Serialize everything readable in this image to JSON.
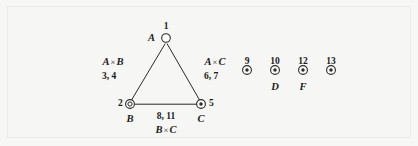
{
  "figure": {
    "kind": "graph-diagram",
    "background_color": "#f6f6f5",
    "frame_color": "#ebebe9",
    "ink_color": "#1b1b1b",
    "triangle": {
      "vertices": [
        {
          "id": "A",
          "node_number": "1",
          "letter": "A",
          "marker": "open-circle",
          "x": 166,
          "y": 38
        },
        {
          "id": "B",
          "node_number": "2",
          "letter": "B",
          "marker": "double-circle",
          "x": 130,
          "y": 104
        },
        {
          "id": "C",
          "node_number": "5",
          "letter": "C",
          "marker": "dotted-circle",
          "x": 201,
          "y": 104
        }
      ],
      "edges": [
        {
          "id": "AB",
          "product": "A",
          "product_operand": "B",
          "operator": "×",
          "numbers": "3, 4"
        },
        {
          "id": "AC",
          "product": "A",
          "product_operand": "C",
          "operator": "×",
          "numbers": "6, 7"
        },
        {
          "id": "BC",
          "product": "B",
          "product_operand": "C",
          "operator": "×",
          "numbers": "8, 11"
        }
      ]
    },
    "isolated_nodes": [
      {
        "node_number": "9",
        "letter": "",
        "marker": "dotted-circle",
        "x": 247
      },
      {
        "node_number": "10",
        "letter": "D",
        "marker": "dotted-circle",
        "x": 275
      },
      {
        "node_number": "12",
        "letter": "F",
        "marker": "dotted-circle",
        "x": 303
      },
      {
        "node_number": "13",
        "letter": "",
        "marker": "dotted-circle",
        "x": 331
      }
    ]
  }
}
